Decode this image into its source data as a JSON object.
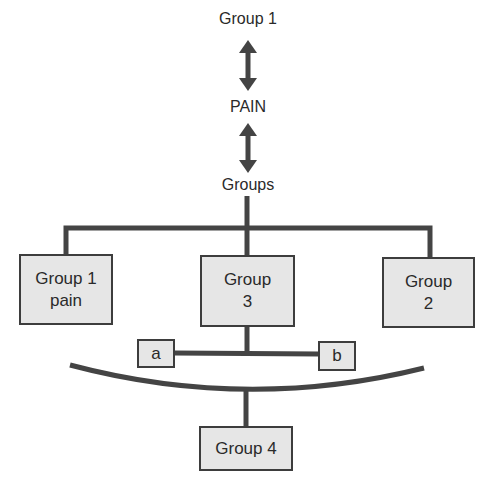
{
  "diagram": {
    "top_label": "Group 1",
    "middle_label": "PAIN",
    "lower_label": "Groups",
    "boxes": {
      "group1_pain": {
        "line1": "Group 1",
        "line2": "pain"
      },
      "group3": {
        "line1": "Group",
        "line2": "3"
      },
      "group2": {
        "line1": "Group",
        "line2": "2"
      },
      "a": {
        "label": "a"
      },
      "b": {
        "label": "b"
      },
      "group4": {
        "label": "Group 4"
      }
    },
    "colors": {
      "line": "#444444",
      "box_fill": "#e6e6e6",
      "box_border": "#3d3d3d",
      "text": "#2a2a2a"
    }
  }
}
